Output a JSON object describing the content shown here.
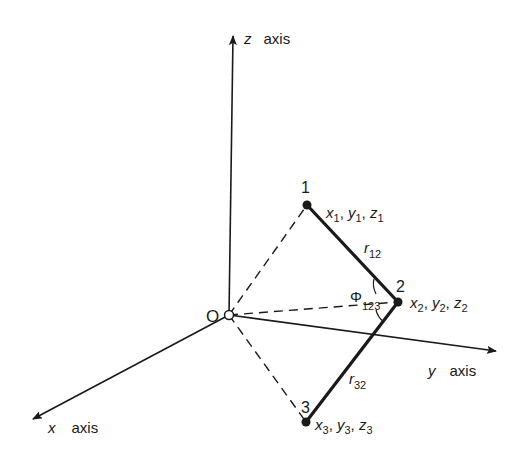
{
  "diagram": {
    "origin": {
      "label": "O",
      "x": 229,
      "y": 315
    },
    "axes": [
      {
        "name": "z",
        "label_var": "z",
        "label_word": "axis",
        "end": {
          "x": 233,
          "y": 35
        }
      },
      {
        "name": "y",
        "label_var": "y",
        "label_word": "axis",
        "end": {
          "x": 496,
          "y": 351
        }
      },
      {
        "name": "x",
        "label_var": "x",
        "label_word": "axis",
        "end": {
          "x": 33,
          "y": 419
        }
      }
    ],
    "points": [
      {
        "id": "1",
        "label": "1",
        "coords_label": [
          "x",
          "1",
          "y",
          "1",
          "z",
          "1"
        ],
        "x": 307,
        "y": 205
      },
      {
        "id": "2",
        "label": "2",
        "coords_label": [
          "x",
          "2",
          "y",
          "2",
          "z",
          "2"
        ],
        "x": 398,
        "y": 302
      },
      {
        "id": "3",
        "label": "3",
        "coords_label": [
          "x",
          "3",
          "y",
          "3",
          "z",
          "3"
        ],
        "x": 306,
        "y": 422
      }
    ],
    "bonds": [
      {
        "from": "1",
        "to": "2",
        "label": "r",
        "sub": "12"
      },
      {
        "from": "3",
        "to": "2",
        "label": "r",
        "sub": "32"
      }
    ],
    "angle": {
      "symbol": "Φ",
      "sub": "123"
    },
    "dashed_lines": [
      {
        "from": "O",
        "to": "1"
      },
      {
        "from": "O",
        "to": "2"
      },
      {
        "from": "O",
        "to": "3"
      }
    ],
    "colors": {
      "ink": "#1a1a1a",
      "background": "#ffffff"
    }
  }
}
